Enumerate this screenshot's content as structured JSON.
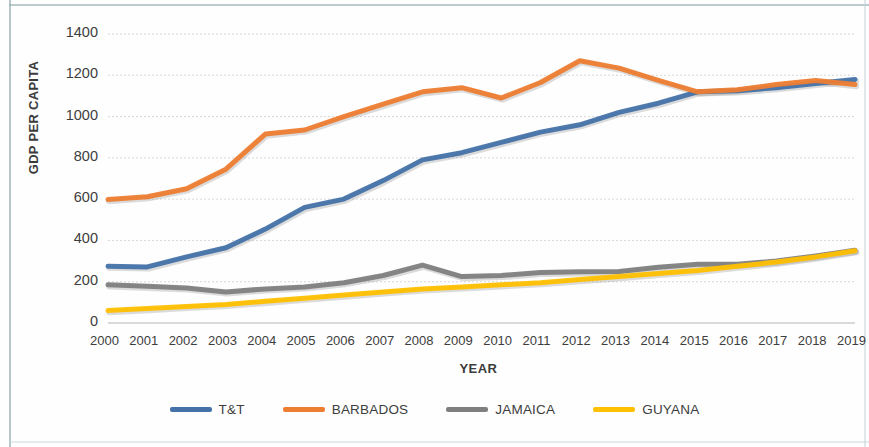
{
  "chart_data": {
    "type": "line",
    "title": "",
    "xlabel": "YEAR",
    "ylabel": "GDP PER CAPITA",
    "x": [
      2000,
      2001,
      2002,
      2003,
      2004,
      2005,
      2006,
      2007,
      2008,
      2009,
      2010,
      2011,
      2012,
      2013,
      2014,
      2015,
      2016,
      2017,
      2018,
      2019
    ],
    "categories": [
      "2000",
      "2001",
      "2002",
      "2003",
      "2004",
      "2005",
      "2006",
      "2007",
      "2008",
      "2009",
      "2010",
      "2011",
      "2012",
      "2013",
      "2014",
      "2015",
      "2016",
      "2017",
      "2018",
      "2019"
    ],
    "ylim": [
      0,
      1400
    ],
    "yticks": [
      0,
      200,
      400,
      600,
      800,
      1000,
      1200,
      1400
    ],
    "ytick_labels": [
      "0",
      "200",
      "400",
      "600",
      "800",
      "1000",
      "1200",
      "1400"
    ],
    "grid": true,
    "legend_position": "bottom",
    "series": [
      {
        "name": "T&T",
        "color": "#4472A8",
        "values": [
          275,
          272,
          320,
          365,
          455,
          560,
          600,
          690,
          790,
          825,
          875,
          925,
          960,
          1020,
          1065,
          1120,
          1125,
          1140,
          1160,
          1180
        ]
      },
      {
        "name": "BARBADOS",
        "color": "#ED7D31",
        "values": [
          598,
          612,
          650,
          745,
          915,
          935,
          1000,
          1060,
          1120,
          1140,
          1090,
          1165,
          1270,
          1235,
          1175,
          1120,
          1130,
          1155,
          1175,
          1155
        ]
      },
      {
        "name": "JAMAICA",
        "color": "#7F7F7F",
        "values": [
          185,
          178,
          170,
          150,
          165,
          175,
          195,
          230,
          280,
          225,
          230,
          245,
          248,
          250,
          270,
          285,
          285,
          300,
          325,
          352
        ]
      },
      {
        "name": "GUYANA",
        "color": "#FFC000",
        "values": [
          60,
          70,
          80,
          90,
          105,
          120,
          135,
          150,
          165,
          175,
          185,
          195,
          210,
          225,
          240,
          255,
          275,
          295,
          320,
          350
        ]
      }
    ]
  },
  "legend": {
    "items": [
      {
        "label": "T&T",
        "color": "#4472A8"
      },
      {
        "label": "BARBADOS",
        "color": "#ED7D31"
      },
      {
        "label": "JAMAICA",
        "color": "#7F7F7F"
      },
      {
        "label": "GUYANA",
        "color": "#FFC000"
      }
    ]
  }
}
